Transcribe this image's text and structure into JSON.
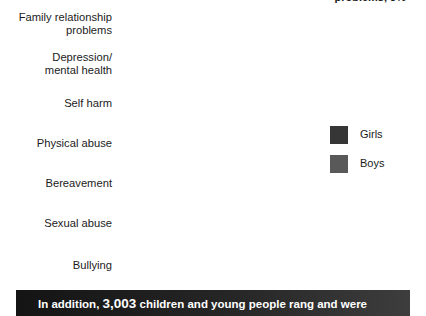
{
  "header": {
    "clipped_text": "problems, 3%"
  },
  "legend": {
    "position": "right-middle",
    "items": [
      {
        "label": "Girls",
        "color": "#363636"
      },
      {
        "label": "Boys",
        "color": "#595959"
      }
    ]
  },
  "banner": {
    "lead": "In addition,",
    "number": "3,003",
    "tail": "children and young people rang and were"
  },
  "chart_data": {
    "type": "bar",
    "orientation": "horizontal",
    "title": "",
    "xlabel": "",
    "ylabel": "",
    "grid": false,
    "legend_position": "right",
    "value_suffix": "%",
    "xlim": [
      0,
      35
    ],
    "categories": [
      "Family relationship\nproblems",
      "Depression/\nmental health",
      "Self harm",
      "Physical abuse",
      "Bereavement",
      "Sexual abuse",
      "Bullying"
    ],
    "series": [
      {
        "name": "Girls",
        "color": "#363636",
        "values": [
          35,
          21,
          22,
          14,
          11,
          15,
          10
        ],
        "labels": [
          "",
          "21%",
          "22%",
          "14%",
          "11%",
          "15%",
          "10%"
        ]
      },
      {
        "name": "Boys",
        "color": "#595959",
        "values": [
          28,
          21,
          13,
          13,
          17,
          5,
          14
        ],
        "labels": [
          "28%",
          "21%",
          "13%",
          "13%",
          "17%",
          "5%",
          "14%"
        ]
      }
    ]
  }
}
